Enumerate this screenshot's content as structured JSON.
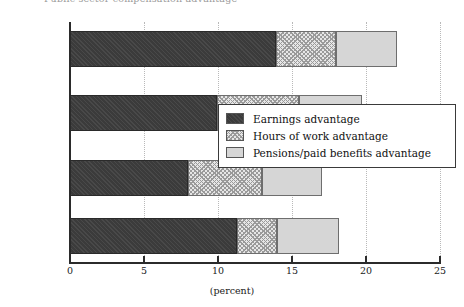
{
  "chart_data": {
    "type": "bar",
    "orientation": "horizontal",
    "stacked": true,
    "title": "Public sector compensation advantage",
    "xlabel": "(percent)",
    "ylabel": "",
    "xlim": [
      0,
      25
    ],
    "xticks": [
      0,
      5,
      10,
      15,
      20,
      25
    ],
    "xticklabels": [
      "0",
      "5",
      "10",
      "15",
      "20",
      "25"
    ],
    "grid": "vertical-dotted",
    "legend_position": "center-right",
    "categories": [
      "Federal",
      "Provincial",
      "Municipal",
      "Institutional"
    ],
    "series": [
      {
        "name": "Earnings advantage",
        "color": "#3b3b3b",
        "pattern": "solid-dark",
        "values": [
          13.9,
          9.9,
          8.0,
          11.3
        ]
      },
      {
        "name": "Hours of work advantage",
        "color": "#e6e6e6",
        "pattern": "cross-hatch",
        "values": [
          4.1,
          5.6,
          5.0,
          2.7
        ]
      },
      {
        "name": "Pensions/paid benefits advantage",
        "color": "#d6d6d6",
        "pattern": "solid-light",
        "values": [
          4.1,
          4.2,
          4.0,
          4.2
        ]
      }
    ],
    "totals": [
      22.1,
      19.7,
      17.0,
      18.2
    ]
  },
  "legend": {
    "items": [
      {
        "label": "Earnings advantage"
      },
      {
        "label": "Hours of work advantage"
      },
      {
        "label": "Pensions/paid benefits advantage"
      }
    ]
  },
  "axis": {
    "x_title": "(percent)"
  }
}
